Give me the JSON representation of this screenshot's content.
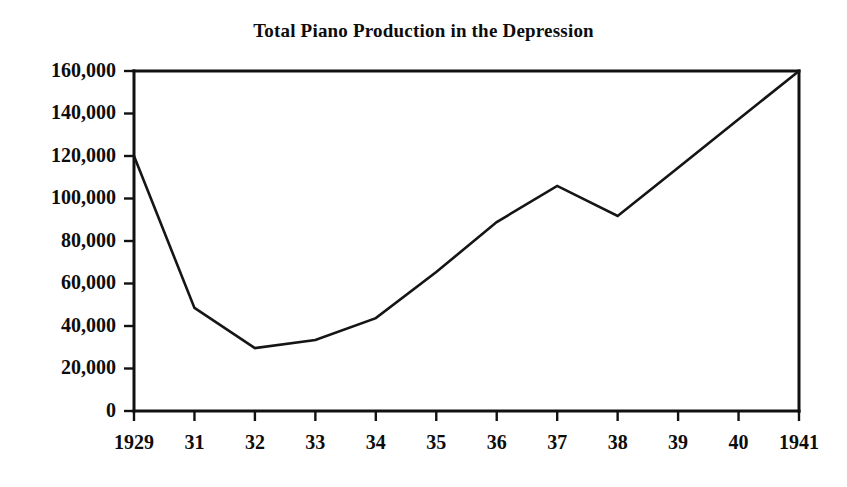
{
  "chart_data": {
    "type": "line",
    "title": "Total Piano Production in the Depression",
    "xlabel": "",
    "ylabel": "",
    "x": [
      "1929",
      "31",
      "32",
      "33",
      "34",
      "35",
      "36",
      "37",
      "38",
      "39",
      "40",
      "1941"
    ],
    "categories": [
      "1929",
      "31",
      "32",
      "33",
      "34",
      "35",
      "36",
      "37",
      "38",
      "39",
      "40",
      "1941"
    ],
    "values": [
      120000,
      48500,
      29600,
      33400,
      43700,
      65400,
      88900,
      105900,
      91800,
      114500,
      137300,
      160000
    ],
    "series": [
      {
        "name": "Total piano production",
        "values": [
          120000,
          48500,
          29600,
          33400,
          43700,
          65400,
          88900,
          105900,
          91800,
          114500,
          137300,
          160000
        ]
      }
    ],
    "ylim": [
      0,
      160000
    ],
    "yticks": [
      0,
      20000,
      40000,
      60000,
      80000,
      100000,
      120000,
      140000,
      160000
    ],
    "ytick_labels": [
      "0",
      "20,000",
      "40,000",
      "60,000",
      "80,000",
      "100,000",
      "120,000",
      "140,000",
      "160,000"
    ],
    "xtick_labels": [
      "1929",
      "31",
      "32",
      "33",
      "34",
      "35",
      "36",
      "37",
      "38",
      "39",
      "40",
      "1941"
    ],
    "grid": false,
    "legend": false,
    "legend_position": "none",
    "line_color": "#151515",
    "axis_color": "#111111",
    "background_color": "#ffffff"
  },
  "figure": {
    "title": "Total Piano Production in the Depression"
  }
}
